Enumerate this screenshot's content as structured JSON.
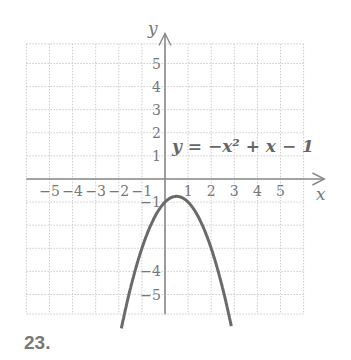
{
  "problem_number": "23.",
  "chart_data": {
    "type": "line",
    "title": "",
    "equation_label": "y = −x² + x − 1",
    "xlabel": "x",
    "ylabel": "y",
    "xlim": [
      -6,
      6
    ],
    "ylim": [
      -6,
      6
    ],
    "grid": true,
    "x_tick_labels": [
      "−5",
      "−4",
      "−3",
      "−2",
      "−1",
      "1",
      "2",
      "3",
      "4",
      "5"
    ],
    "y_tick_labels": [
      "5",
      "4",
      "3",
      "2",
      "1",
      "−1",
      "−4",
      "−5"
    ],
    "series": [
      {
        "name": "y = -x^2 + x - 1",
        "function": "-x^2 + x - 1",
        "vertex": [
          0.5,
          -0.75
        ],
        "y_intercept": -1,
        "x": [
          -1.89,
          -1.5,
          -1,
          -0.5,
          0,
          0.5,
          1,
          1.5,
          2,
          2.5,
          2.89
        ],
        "y": [
          -6,
          -4.75,
          -3,
          -1.75,
          -1,
          -0.75,
          -1,
          -1.75,
          -3,
          -4.75,
          -6
        ]
      }
    ]
  }
}
